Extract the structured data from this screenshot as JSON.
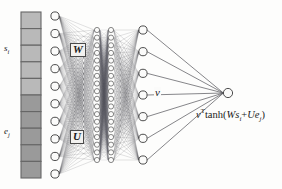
{
  "figure": {
    "type": "neural-network-diagram",
    "width": 282,
    "height": 189,
    "background_color": "#fdfdfc"
  },
  "labels": {
    "input_upper": "s",
    "input_upper_sub": "i",
    "input_lower": "e",
    "input_lower_sub": "j",
    "weight_W": "W",
    "weight_U": "U",
    "weight_v": "v",
    "output_formula_prefix": "v",
    "output_formula_transpose": "T",
    "output_formula_body": "tanh(",
    "output_formula_W": "W",
    "output_formula_s": "s",
    "output_formula_s_sub": "i",
    "output_formula_plus": "+",
    "output_formula_U": "U",
    "output_formula_e": "e",
    "output_formula_e_sub": "j",
    "output_formula_close": ")",
    "output_formula_full": "vᵀtanh(Wsᵢ+Ueⱼ)"
  },
  "colors": {
    "cell_light": "#b9b9b9",
    "cell_dark": "#9a9a9a",
    "cell_border": "#666666",
    "node_fill": "#fbfbfa",
    "node_stroke": "#3a3a3a",
    "edge_color": "#55555a",
    "text_color": "#1a1a1a"
  },
  "layers": {
    "input_vector": {
      "name": "input-vector",
      "cell_count": 10,
      "light_cells": 5,
      "dark_cells": 5,
      "x": 21,
      "width": 20,
      "y_top": 12,
      "y_bottom": 178
    },
    "hidden_1": {
      "name": "hidden-layer-1",
      "node_count": 10,
      "x": 55,
      "radius": 4.1,
      "y_top": 16,
      "y_bottom": 174
    },
    "hidden_2": {
      "name": "hidden-layer-2-dense",
      "node_count": 18,
      "x": 97,
      "radius": 2.6,
      "y_top": 30,
      "y_bottom": 160
    },
    "hidden_3": {
      "name": "hidden-layer-3-dense",
      "node_count": 18,
      "x": 111,
      "radius": 2.6,
      "y_top": 30,
      "y_bottom": 160
    },
    "hidden_4": {
      "name": "hidden-layer-4",
      "node_count": 7,
      "x": 143,
      "radius": 4.1,
      "y_top": 30,
      "y_bottom": 160
    },
    "output": {
      "name": "output-node",
      "node_count": 1,
      "x": 228,
      "y": 93,
      "radius": 4.6
    }
  }
}
